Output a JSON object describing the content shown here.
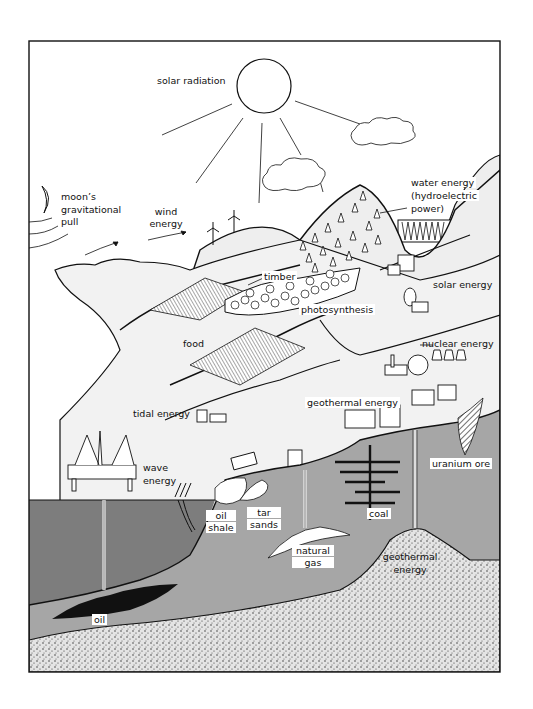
{
  "diagram": {
    "labels": {
      "solar_radiation": "solar radiation",
      "moon_line1": "moon’s",
      "moon_line2": "gravitational",
      "moon_line3": "pull",
      "wind_line1": "wind",
      "wind_line2": "energy",
      "water_line1": "water energy",
      "water_line2": "(hydroelectric",
      "water_line3": "power)",
      "timber": "timber",
      "solar_energy": "solar energy",
      "photosynthesis": "photosynthesis",
      "food": "food",
      "nuclear_energy": "nuclear energy",
      "tidal_energy": "tidal energy",
      "geothermal_energy_surface": "geothermal energy",
      "wave_line1": "wave",
      "wave_line2": "energy",
      "uranium_ore": "uranium ore",
      "oil_shale_line1": "oil",
      "oil_shale_line2": "shale",
      "tar_sands_line1": "tar",
      "tar_sands_line2": "sands",
      "coal": "coal",
      "natural_gas_line1": "natural",
      "natural_gas_line2": "gas",
      "geothermal_deep_line1": "geothermal",
      "geothermal_deep_line2": "energy",
      "oil": "oil"
    },
    "colors": {
      "ink": "#111111",
      "sea": "#7a7a7a",
      "rock": "#a8a8a8",
      "land": "#f0f0f0",
      "magma": "#d9d9d9",
      "paper": "#ffffff"
    }
  }
}
